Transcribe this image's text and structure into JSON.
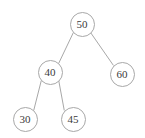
{
  "figure": {
    "kind": "binary-search-tree-diagram",
    "width": 145,
    "height": 138,
    "background_color": "#ffffff",
    "node_fill_color": "#ffffff",
    "node_stroke_color": "#a8a8a8",
    "edge_color": "#a8a8a8",
    "label_color": "#3a3a3a",
    "node_radius": 12.5,
    "node_stroke_width": 1,
    "edge_stroke_width": 1,
    "label_font_size": 11
  },
  "chart_data": {
    "type": "diagram",
    "title": "",
    "nodes": [
      {
        "id": "n50",
        "label": "50",
        "value": 50,
        "cx": 82,
        "cy": 24,
        "r": 12.5,
        "level": 0,
        "role": "root"
      },
      {
        "id": "n40",
        "label": "40",
        "value": 40,
        "cx": 50,
        "cy": 72,
        "r": 12.5,
        "level": 1,
        "role": "left-child"
      },
      {
        "id": "n60",
        "label": "60",
        "value": 60,
        "cx": 122,
        "cy": 74,
        "r": 12.5,
        "level": 1,
        "role": "right-child"
      },
      {
        "id": "n30",
        "label": "30",
        "value": 30,
        "cx": 25,
        "cy": 119,
        "r": 12.5,
        "level": 2,
        "role": "left-leaf"
      },
      {
        "id": "n45",
        "label": "45",
        "value": 45,
        "cx": 73,
        "cy": 119,
        "r": 12.5,
        "level": 2,
        "role": "right-leaf"
      }
    ],
    "edges": [
      {
        "id": "e50-40",
        "from": "n50",
        "to": "n40",
        "x1": 73.2,
        "y1": 32.9,
        "x2": 58.8,
        "y2": 63.1
      },
      {
        "id": "e50-60",
        "from": "n50",
        "to": "n60",
        "x1": 90.8,
        "y1": 32.9,
        "x2": 113.2,
        "y2": 65.1
      },
      {
        "id": "e40-30",
        "from": "n40",
        "to": "n30",
        "x1": 41.2,
        "y1": 80.9,
        "x2": 33.8,
        "y2": 110.1
      },
      {
        "id": "e40-45",
        "from": "n40",
        "to": "n45",
        "x1": 58.8,
        "y1": 80.9,
        "x2": 64.2,
        "y2": 110.1
      }
    ]
  }
}
